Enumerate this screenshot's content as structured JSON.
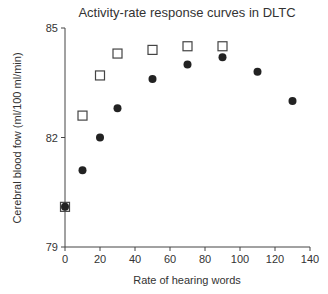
{
  "chart_data": {
    "type": "scatter",
    "title": "Activity-rate response curves in DLTC",
    "xlabel": "Rate of hearing words",
    "ylabel": "Cerebral blood fow (ml/100 ml/min)",
    "xlim": [
      0,
      140
    ],
    "ylim": [
      79,
      85
    ],
    "xticks": [
      0,
      20,
      40,
      60,
      80,
      100,
      120,
      140
    ],
    "yticks": [
      79,
      82,
      85
    ],
    "grid": false,
    "legend": null,
    "series": [
      {
        "name": "open-squares",
        "marker": "square-open",
        "color": "#444444",
        "x": [
          0,
          10,
          20,
          30,
          50,
          70,
          90
        ],
        "y": [
          80.1,
          82.6,
          83.7,
          84.3,
          84.4,
          84.5,
          84.5
        ]
      },
      {
        "name": "filled-circles",
        "marker": "circle-filled",
        "color": "#222222",
        "x": [
          0,
          10,
          20,
          30,
          50,
          70,
          90,
          110,
          130
        ],
        "y": [
          80.1,
          81.1,
          82.0,
          82.8,
          83.6,
          84.0,
          84.2,
          83.8,
          83.0
        ]
      }
    ]
  }
}
